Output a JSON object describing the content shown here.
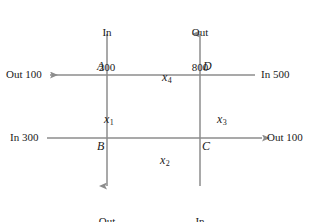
{
  "diagram": {
    "type": "network-flow",
    "nodes": [
      {
        "id": "A",
        "label": "A"
      },
      {
        "id": "B",
        "label": "B"
      },
      {
        "id": "C",
        "label": "C"
      },
      {
        "id": "D",
        "label": "D"
      }
    ],
    "variables": [
      {
        "id": "x1",
        "symbol": "x",
        "subscript": "1",
        "edge": "A-B"
      },
      {
        "id": "x2",
        "symbol": "x",
        "subscript": "2",
        "edge": "B-C"
      },
      {
        "id": "x3",
        "symbol": "x",
        "subscript": "3",
        "edge": "C-D"
      },
      {
        "id": "x4",
        "symbol": "x",
        "subscript": "4",
        "edge": "D-A"
      }
    ],
    "flows": {
      "top_left": {
        "direction": "In",
        "value": "200"
      },
      "top_right": {
        "direction": "Out",
        "value": "800"
      },
      "left_upper": {
        "direction_value": "Out 100"
      },
      "right_upper": {
        "direction_value": "In 500"
      },
      "left_lower": {
        "direction_value": "In 300"
      },
      "right_lower": {
        "direction_value": "Out 100"
      },
      "bottom_left": {
        "direction": "Out",
        "value": "200"
      },
      "bottom_right": {
        "direction": "In",
        "value": "200"
      }
    },
    "colors": {
      "line": "#8c8c8c",
      "text": "#1a1a1a",
      "background": "#ffffff"
    }
  }
}
